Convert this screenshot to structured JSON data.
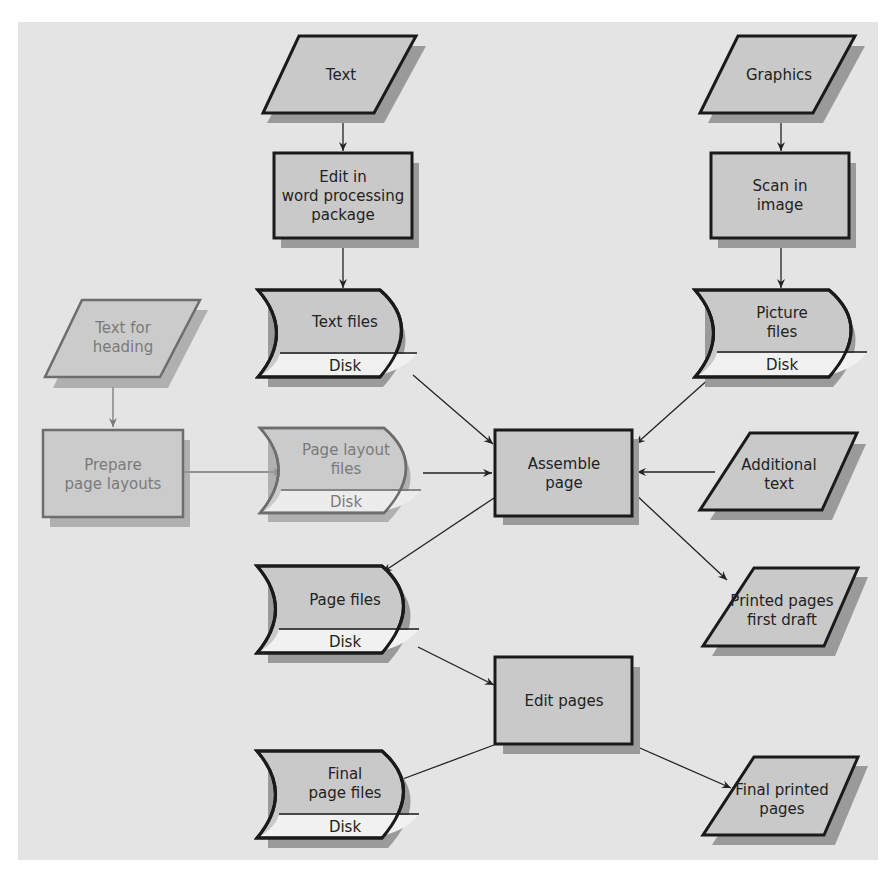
{
  "diagram": {
    "title": "",
    "nodes": {
      "text_input": {
        "shape": "parallelogram",
        "lines": [
          "Text"
        ]
      },
      "edit_word": {
        "shape": "process",
        "lines": [
          "Edit in",
          "word processing",
          "package"
        ]
      },
      "text_files": {
        "shape": "stored-data",
        "lines": [
          "Text files"
        ],
        "medium": "Disk"
      },
      "graphics_input": {
        "shape": "parallelogram",
        "lines": [
          "Graphics"
        ]
      },
      "scan_image": {
        "shape": "process",
        "lines": [
          "Scan in",
          "image"
        ]
      },
      "picture_files": {
        "shape": "stored-data",
        "lines": [
          "Picture",
          "files"
        ],
        "medium": "Disk"
      },
      "heading_input": {
        "shape": "parallelogram",
        "lines": [
          "Text for",
          "heading"
        ],
        "dimmed": true
      },
      "prepare_layouts": {
        "shape": "process",
        "lines": [
          "Prepare",
          "page layouts"
        ],
        "dimmed": true
      },
      "layout_files": {
        "shape": "stored-data",
        "lines": [
          "Page layout",
          "files"
        ],
        "medium": "Disk",
        "dimmed": true
      },
      "assemble_page": {
        "shape": "process",
        "lines": [
          "Assemble",
          "page"
        ]
      },
      "additional_text": {
        "shape": "parallelogram",
        "lines": [
          "Additional",
          "text"
        ]
      },
      "page_files": {
        "shape": "stored-data",
        "lines": [
          "Page files"
        ],
        "medium": "Disk"
      },
      "printed_draft": {
        "shape": "parallelogram",
        "lines": [
          "Printed pages",
          "first draft"
        ]
      },
      "edit_pages": {
        "shape": "process",
        "lines": [
          "Edit pages"
        ]
      },
      "final_files": {
        "shape": "stored-data",
        "lines": [
          "Final",
          "page files"
        ],
        "medium": "Disk"
      },
      "final_printed": {
        "shape": "parallelogram",
        "lines": [
          "Final printed",
          "pages"
        ]
      }
    },
    "edges": [
      {
        "from": "text_input",
        "to": "edit_word"
      },
      {
        "from": "edit_word",
        "to": "text_files"
      },
      {
        "from": "graphics_input",
        "to": "scan_image"
      },
      {
        "from": "scan_image",
        "to": "picture_files"
      },
      {
        "from": "heading_input",
        "to": "prepare_layouts",
        "dimmed": true
      },
      {
        "from": "prepare_layouts",
        "to": "layout_files",
        "dimmed": true
      },
      {
        "from": "text_files",
        "to": "assemble_page"
      },
      {
        "from": "picture_files",
        "to": "assemble_page"
      },
      {
        "from": "layout_files",
        "to": "assemble_page"
      },
      {
        "from": "additional_text",
        "to": "assemble_page"
      },
      {
        "from": "assemble_page",
        "to": "page_files"
      },
      {
        "from": "assemble_page",
        "to": "printed_draft"
      },
      {
        "from": "page_files",
        "to": "edit_pages"
      },
      {
        "from": "edit_pages",
        "to": "final_files"
      },
      {
        "from": "edit_pages",
        "to": "final_printed"
      }
    ]
  },
  "colors": {
    "panel": "#e4e4e4",
    "node_fill": "#c9c9c9",
    "disk_band": "#f1f1f1",
    "shadow": "#9a9a9a",
    "stroke": "#1a1a1a",
    "dimmed_stroke": "#6d6d6d"
  }
}
